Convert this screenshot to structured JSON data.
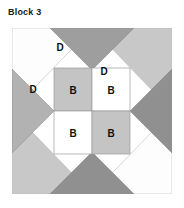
{
  "block": {
    "title": "Block 3",
    "frame": {
      "border_color": "#9a9a9a",
      "background": "#ffffff"
    },
    "colors": {
      "white": "#ffffff",
      "light_gray": "#c8c8c8",
      "medium_gray": "#a8a8a8",
      "dark_gray": "#8e8e8e",
      "outline": "#8f8f8f",
      "label_text": "#111111"
    },
    "corner_triangles": [
      {
        "name": "corner-top-left",
        "fill": "#ffffff",
        "label": ""
      },
      {
        "name": "corner-top-right",
        "fill": "#c8c8c8",
        "label": ""
      },
      {
        "name": "corner-bottom-right",
        "fill": "#ffffff",
        "label": ""
      },
      {
        "name": "corner-bottom-left",
        "fill": "#c8c8c8",
        "label": ""
      }
    ],
    "edge_triangles": [
      {
        "name": "edge-top",
        "fill": "#9a9a9a",
        "label": "D"
      },
      {
        "name": "edge-right",
        "fill": "#8e8e8e",
        "label": ""
      },
      {
        "name": "edge-bottom",
        "fill": "#8e8e8e",
        "label": ""
      },
      {
        "name": "edge-left",
        "fill": "#b0b0b0",
        "label": "D"
      }
    ],
    "outer_labels": [
      {
        "name": "label-d-top-left",
        "text": "D",
        "x": 48,
        "y": 18
      },
      {
        "name": "label-d-top-center",
        "text": "D",
        "x": 90,
        "y": 40
      },
      {
        "name": "label-d-left",
        "text": "D",
        "x": 22,
        "y": 60
      }
    ],
    "center_patches": [
      {
        "name": "center-patch-top-left",
        "fill": "#c4c4c4",
        "label": "B"
      },
      {
        "name": "center-patch-top-right",
        "fill": "#ffffff",
        "label": "B"
      },
      {
        "name": "center-patch-bottom-left",
        "fill": "#ffffff",
        "label": "B"
      },
      {
        "name": "center-patch-bottom-right",
        "fill": "#c4c4c4",
        "label": "B"
      }
    ]
  }
}
